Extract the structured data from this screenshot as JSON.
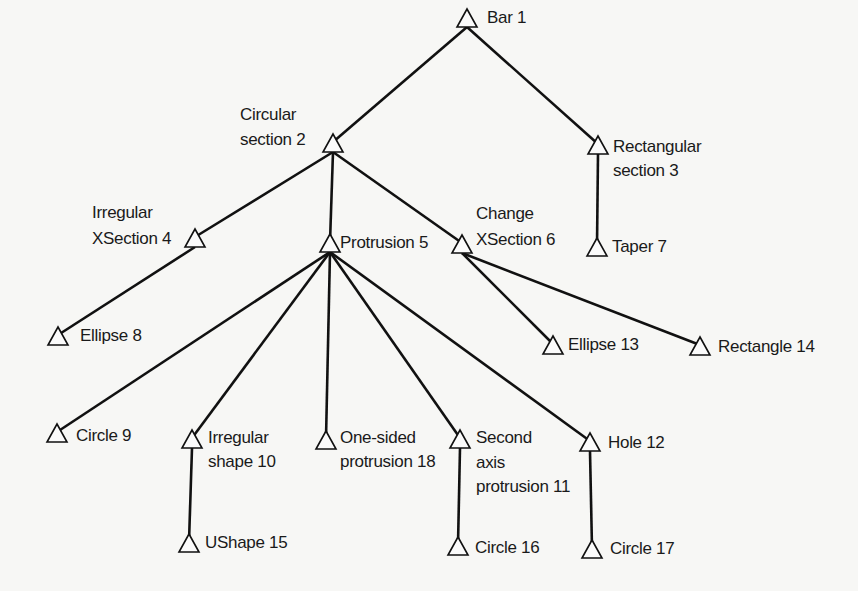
{
  "diagram": {
    "type": "tree",
    "background": "#f7f7f5",
    "line_color": "#111111",
    "nodes": [
      {
        "id": 1,
        "lines": [
          "Bar 1"
        ],
        "x": 467,
        "y": 9,
        "lx": 487,
        "ly": [
          23
        ],
        "anchor": "start"
      },
      {
        "id": 2,
        "lines": [
          "Circular",
          "section 2"
        ],
        "x": 333,
        "y": 134,
        "lx": 240,
        "ly": [
          120,
          145
        ],
        "anchor": "start"
      },
      {
        "id": 3,
        "lines": [
          "Rectangular",
          "section 3"
        ],
        "x": 598,
        "y": 136,
        "lx": 613,
        "ly": [
          152,
          176
        ],
        "anchor": "start"
      },
      {
        "id": 4,
        "lines": [
          "Irregular",
          "XSection 4"
        ],
        "x": 195,
        "y": 229,
        "lx": 92,
        "ly": [
          218,
          244
        ],
        "anchor": "start"
      },
      {
        "id": 5,
        "lines": [
          "Protrusion 5"
        ],
        "x": 330,
        "y": 234,
        "lx": 340,
        "ly": [
          248
        ],
        "anchor": "start"
      },
      {
        "id": 6,
        "lines": [
          "Change",
          "XSection 6"
        ],
        "x": 462,
        "y": 235,
        "lx": 476,
        "ly": [
          219,
          245
        ],
        "anchor": "start"
      },
      {
        "id": 7,
        "lines": [
          "Taper 7"
        ],
        "x": 597,
        "y": 238,
        "lx": 612,
        "ly": [
          252
        ],
        "anchor": "start"
      },
      {
        "id": 8,
        "lines": [
          "Ellipse 8"
        ],
        "x": 58,
        "y": 327,
        "lx": 80,
        "ly": [
          341
        ],
        "anchor": "start"
      },
      {
        "id": 9,
        "lines": [
          "Circle 9"
        ],
        "x": 57,
        "y": 424,
        "lx": 76,
        "ly": [
          441
        ],
        "anchor": "start"
      },
      {
        "id": 10,
        "lines": [
          "Irregular",
          "shape 10"
        ],
        "x": 192,
        "y": 430,
        "lx": 208,
        "ly": [
          443,
          467
        ],
        "anchor": "start"
      },
      {
        "id": 11,
        "lines": [
          "Second",
          "axis",
          "protrusion 11"
        ],
        "x": 460,
        "y": 430,
        "lx": 476,
        "ly": [
          443,
          468,
          492
        ],
        "anchor": "start"
      },
      {
        "id": 12,
        "lines": [
          "Hole 12"
        ],
        "x": 590,
        "y": 433,
        "lx": 608,
        "ly": [
          448
        ],
        "anchor": "start"
      },
      {
        "id": 13,
        "lines": [
          "Ellipse 13"
        ],
        "x": 553,
        "y": 336,
        "lx": 568,
        "ly": [
          350
        ],
        "anchor": "start"
      },
      {
        "id": 14,
        "lines": [
          "Rectangle 14"
        ],
        "x": 700,
        "y": 337,
        "lx": 718,
        "ly": [
          352
        ],
        "anchor": "start"
      },
      {
        "id": 15,
        "lines": [
          "UShape 15"
        ],
        "x": 189,
        "y": 534,
        "lx": 205,
        "ly": [
          548
        ],
        "anchor": "start"
      },
      {
        "id": 16,
        "lines": [
          "Circle 16"
        ],
        "x": 458,
        "y": 537,
        "lx": 475,
        "ly": [
          553
        ],
        "anchor": "start"
      },
      {
        "id": 17,
        "lines": [
          "Circle 17"
        ],
        "x": 592,
        "y": 540,
        "lx": 610,
        "ly": [
          554
        ],
        "anchor": "start"
      },
      {
        "id": 18,
        "lines": [
          "One-sided",
          "protrusion 18"
        ],
        "x": 326,
        "y": 431,
        "lx": 340,
        "ly": [
          443,
          467
        ],
        "anchor": "start"
      }
    ],
    "edges": [
      [
        1,
        2
      ],
      [
        1,
        3
      ],
      [
        2,
        4
      ],
      [
        2,
        5
      ],
      [
        2,
        6
      ],
      [
        3,
        7
      ],
      [
        4,
        8
      ],
      [
        5,
        9
      ],
      [
        5,
        10
      ],
      [
        5,
        18
      ],
      [
        5,
        11
      ],
      [
        5,
        12
      ],
      [
        6,
        13
      ],
      [
        6,
        14
      ],
      [
        10,
        15
      ],
      [
        11,
        16
      ],
      [
        12,
        17
      ]
    ]
  }
}
